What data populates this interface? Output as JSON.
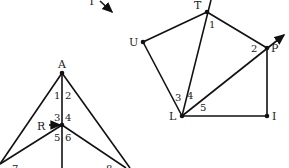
{
  "diagram": {
    "top_left_fragment": {
      "label": "T",
      "arrow": "down-right"
    },
    "left_figure": {
      "points": [
        {
          "name": "A",
          "x": 62,
          "y": 73
        },
        {
          "name": "R",
          "x": 62,
          "y": 125
        }
      ],
      "angle_labels": [
        {
          "label": "1",
          "x": 55,
          "y": 100
        },
        {
          "label": "2",
          "x": 65,
          "y": 100
        },
        {
          "label": "3",
          "x": 55,
          "y": 119
        },
        {
          "label": "4",
          "x": 65,
          "y": 119
        },
        {
          "label": "5",
          "x": 55,
          "y": 139
        },
        {
          "label": "6",
          "x": 65,
          "y": 139
        },
        {
          "label": "7",
          "x": 12,
          "y": 168
        },
        {
          "label": "8",
          "x": 106,
          "y": 168
        }
      ],
      "r_label": "R"
    },
    "right_figure": {
      "points": [
        {
          "name": "T",
          "x": 207,
          "y": 12
        },
        {
          "name": "U",
          "x": 143,
          "y": 42
        },
        {
          "name": "P",
          "x": 267,
          "y": 48
        },
        {
          "name": "L",
          "x": 182,
          "y": 116
        },
        {
          "name": "I",
          "x": 267,
          "y": 116
        }
      ],
      "angle_labels": [
        {
          "label": "1",
          "x": 209,
          "y": 28
        },
        {
          "label": "2",
          "x": 251,
          "y": 52
        },
        {
          "label": "3",
          "x": 176,
          "y": 100
        },
        {
          "label": "4",
          "x": 188,
          "y": 98
        },
        {
          "label": "5",
          "x": 200,
          "y": 110
        }
      ]
    }
  }
}
